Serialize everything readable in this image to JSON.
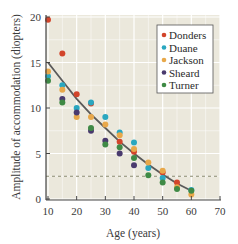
{
  "chart_data": {
    "type": "scatter",
    "title": "",
    "xlabel": "Age (years)",
    "ylabel": "Amplitude of accommodation (diopters)",
    "xlim": [
      10,
      70
    ],
    "ylim": [
      0,
      20
    ],
    "x_ticks": [
      10,
      20,
      30,
      40,
      50,
      60,
      70
    ],
    "y_ticks": [
      0,
      5,
      10,
      15,
      20
    ],
    "grid": true,
    "legend_position": "upper right",
    "series": [
      {
        "name": "Donders",
        "color": "#d2452b",
        "points": [
          [
            10,
            19.7
          ],
          [
            15,
            16
          ],
          [
            20,
            11.5
          ],
          [
            25,
            10.5
          ],
          [
            35,
            6.3
          ],
          [
            40,
            5.2
          ],
          [
            50,
            2.9
          ],
          [
            55,
            1.8
          ]
        ]
      },
      {
        "name": "Duane",
        "color": "#2aa7c0",
        "points": [
          [
            10,
            13.5
          ],
          [
            15,
            12.5
          ],
          [
            20,
            10
          ],
          [
            25,
            10.6
          ],
          [
            30,
            9
          ],
          [
            35,
            7.3
          ],
          [
            40,
            6.2
          ],
          [
            45,
            3.4
          ],
          [
            50,
            2.3
          ],
          [
            60,
            1
          ]
        ]
      },
      {
        "name": "Jackson",
        "color": "#e8a84a",
        "points": [
          [
            10,
            14
          ],
          [
            15,
            12
          ],
          [
            20,
            9
          ],
          [
            25,
            9
          ],
          [
            30,
            8.2
          ],
          [
            35,
            7
          ],
          [
            40,
            5.5
          ],
          [
            45,
            4
          ],
          [
            50,
            3.1
          ],
          [
            55,
            1.3
          ],
          [
            60,
            0.5
          ]
        ]
      },
      {
        "name": "Sheard",
        "color": "#4a3a6e",
        "points": [
          [
            15,
            11
          ],
          [
            20,
            9.5
          ],
          [
            25,
            7.5
          ],
          [
            30,
            6.4
          ],
          [
            35,
            5
          ],
          [
            40,
            3.7
          ]
        ]
      },
      {
        "name": "Turner",
        "color": "#3f8a45",
        "points": [
          [
            10,
            13
          ],
          [
            15,
            10.6
          ],
          [
            25,
            7.8
          ],
          [
            30,
            6
          ],
          [
            35,
            5.7
          ],
          [
            40,
            4.5
          ],
          [
            45,
            2.6
          ],
          [
            50,
            1.8
          ],
          [
            55,
            1.1
          ],
          [
            60,
            0.9
          ]
        ]
      }
    ],
    "trend_line": {
      "color": "#5a5a5a",
      "points": [
        [
          10,
          15
        ],
        [
          15,
          13
        ],
        [
          20,
          11
        ],
        [
          25,
          9.3
        ],
        [
          30,
          7.8
        ],
        [
          35,
          6.3
        ],
        [
          40,
          5
        ],
        [
          45,
          3.8
        ],
        [
          50,
          2.7
        ],
        [
          55,
          1.7
        ],
        [
          60,
          0.9
        ]
      ]
    },
    "reference_line": {
      "style": "dashed",
      "y": 2.5,
      "color": "#8a8a70"
    },
    "colors": {
      "plot_background": "#ebe8dc",
      "grid": "#ffffff",
      "axis": "#444444",
      "legend_background": "#ffffff",
      "legend_border": "#555555"
    }
  }
}
